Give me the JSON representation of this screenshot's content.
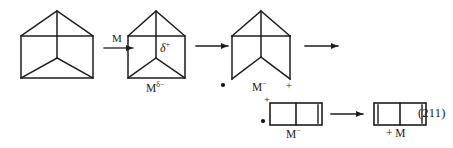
{
  "figure": {
    "kind": "chemical-reaction-scheme",
    "equation_number": "(211)",
    "background_color": "#ffffff",
    "line_color": "#1c1c1c",
    "text_color": "#1a1a1a"
  },
  "labels": {
    "arrow1_reagent": "M",
    "struct2_charge": "δ",
    "struct2_charge_sign": "+",
    "struct2_metal": "M",
    "struct2_metal_charge": "δ−",
    "struct3_radical_dot": "•",
    "struct3_metal": "M",
    "struct3_metal_charge": "−",
    "struct3_plus": "+",
    "struct4_plus": "+",
    "struct4_radical_dot": "•",
    "struct4_metal": "M",
    "struct4_metal_charge": "−",
    "product_plus_metal": "+ M",
    "equation_number": "(211)"
  },
  "structures": [
    {
      "id": "prismane-start",
      "name": "prismane-reactant",
      "description": "house-shaped prismane: pentagon outline with horizontal crossbar, vertical apex-to-center bond and two diagonals to bottom corners",
      "bottom_edge_present": true,
      "inner_label": ""
    },
    {
      "id": "prismane-polarized",
      "name": "prismane-metal-complex",
      "description": "same prismane with partial positive charge marked inside and metal with partial negative charge below",
      "bottom_edge_present": true,
      "inner_label": "δ+"
    },
    {
      "id": "prismane-opened",
      "name": "ring-opened-zwitterion",
      "description": "prismane with bottom edge cleaved; legs splay open; radical dot at left terminus, cation at right terminus",
      "bottom_edge_present": false,
      "inner_label": ""
    },
    {
      "id": "bicyclic-intermediate",
      "name": "fused-four-membered-intermediate",
      "description": "two fused squares with a double bond on the right edge; carries plus and radical dot on the left and metal anion below",
      "double_bond_edges": [
        "right"
      ]
    },
    {
      "id": "bicyclic-product",
      "name": "cyclobutadiene-product",
      "description": "two fused squares with double bonds on both left and right edges; metal released",
      "double_bond_edges": [
        "left",
        "right"
      ]
    }
  ],
  "arrows": [
    {
      "id": "arrow-1",
      "name": "reaction-arrow-1",
      "label_above": "M"
    },
    {
      "id": "arrow-2",
      "name": "reaction-arrow-2",
      "label_above": ""
    },
    {
      "id": "arrow-3",
      "name": "reaction-arrow-3",
      "label_above": ""
    },
    {
      "id": "arrow-4",
      "name": "reaction-arrow-4",
      "label_above": ""
    }
  ]
}
